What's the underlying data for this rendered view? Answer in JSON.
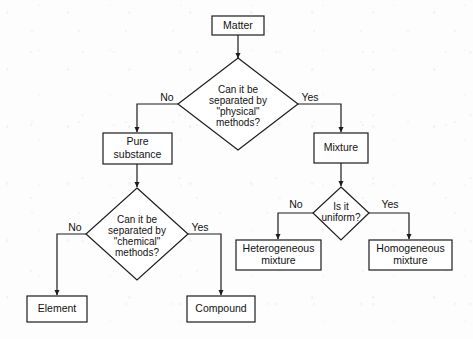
{
  "diagram": {
    "type": "flowchart",
    "colors": {
      "background": "#fdfdfd",
      "stroke": "#1c1c1c",
      "node_fill": "#ffffff",
      "text": "#111111"
    },
    "nodes": {
      "matter": {
        "label": "Matter",
        "shape": "rectangle"
      },
      "physical_question": {
        "shape": "diamond",
        "lines": [
          "Can it be",
          "separated by",
          "\"physical\"",
          "methods?"
        ]
      },
      "pure_substance": {
        "shape": "rectangle",
        "lines": [
          "Pure",
          "substance"
        ]
      },
      "mixture": {
        "label": "Mixture",
        "shape": "rectangle"
      },
      "chemical_question": {
        "shape": "diamond",
        "lines": [
          "Can it be",
          "separated by",
          "\"chemical\"",
          "methods?"
        ]
      },
      "uniform_question": {
        "shape": "diamond",
        "lines": [
          "Is it",
          "uniform?"
        ]
      },
      "element": {
        "label": "Element",
        "shape": "rectangle"
      },
      "compound": {
        "label": "Compound",
        "shape": "rectangle"
      },
      "heterogeneous": {
        "shape": "rectangle",
        "lines": [
          "Heterogeneous",
          "mixture"
        ]
      },
      "homogeneous": {
        "shape": "rectangle",
        "lines": [
          "Homogeneous",
          "mixture"
        ]
      }
    },
    "edge_labels": {
      "physical_no": "No",
      "physical_yes": "Yes",
      "chemical_no": "No",
      "chemical_yes": "Yes",
      "uniform_no": "No",
      "uniform_yes": "Yes"
    }
  }
}
